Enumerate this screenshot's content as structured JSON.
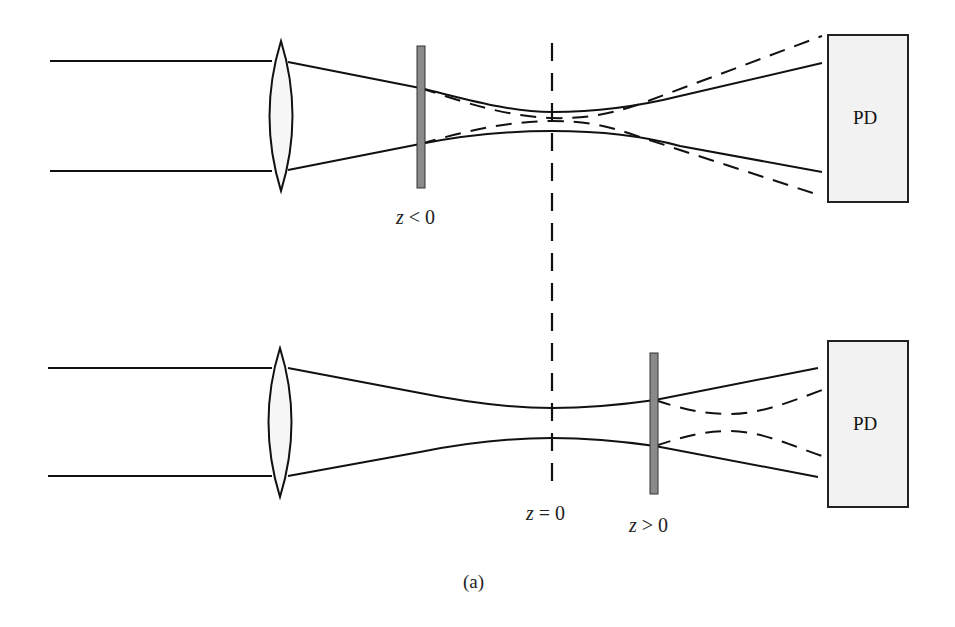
{
  "figure": {
    "caption": "(a)"
  },
  "top_panel": {
    "sample_label_var": "z",
    "sample_label_rest": " < 0",
    "detector_label": "PD"
  },
  "bottom_panel": {
    "focus_label_var": "z",
    "focus_label_rest": " = 0",
    "sample_label_var": "z",
    "sample_label_rest": " > 0",
    "detector_label": "PD"
  },
  "colors": {
    "line": "#111111",
    "sample_fill": "#8a8a8a",
    "detector_fill": "#f2f2f2",
    "lens_fill": "#f7f7f7"
  }
}
